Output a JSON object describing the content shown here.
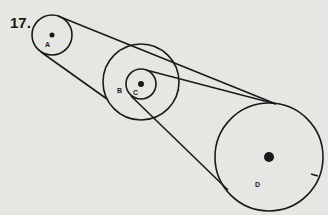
{
  "problem": {
    "number": "17."
  },
  "diagram": {
    "type": "pulley-belt-system",
    "stroke_color": "#1a1a1a",
    "background_color": "#e6e6e2",
    "pulleys": [
      {
        "id": "A",
        "label": "A",
        "cx": 52,
        "cy": 35,
        "r": 20,
        "hub_r": 2.5,
        "label_x": 45,
        "label_y": 47
      },
      {
        "id": "B",
        "label": "B",
        "cx": 141,
        "cy": 82,
        "r": 38,
        "hub_r": 0,
        "label_x": 117,
        "label_y": 93
      },
      {
        "id": "C",
        "label": "C",
        "cx": 141,
        "cy": 84,
        "r": 15,
        "hub_r": 3,
        "label_x": 133,
        "label_y": 95
      },
      {
        "id": "D",
        "label": "D",
        "cx": 269,
        "cy": 157,
        "r": 54,
        "hub_r": 5,
        "label_x": 255,
        "label_y": 187
      }
    ],
    "belts": [
      {
        "from": "A",
        "to": "D",
        "x1": 58,
        "y1": 16,
        "x2": 276,
        "y2": 104
      },
      {
        "from": "A",
        "to": "B",
        "x1": 41,
        "y1": 52,
        "x2": 107,
        "y2": 99
      },
      {
        "from": "C",
        "to": "D",
        "x1": 146,
        "y1": 70,
        "x2": 276,
        "y2": 104
      },
      {
        "from": "C",
        "to": "D",
        "x1": 131,
        "y1": 96,
        "x2": 228,
        "y2": 190
      }
    ],
    "marker": {
      "on": "D",
      "x1": 311,
      "y1": 174,
      "x2": 318,
      "y2": 176
    }
  }
}
